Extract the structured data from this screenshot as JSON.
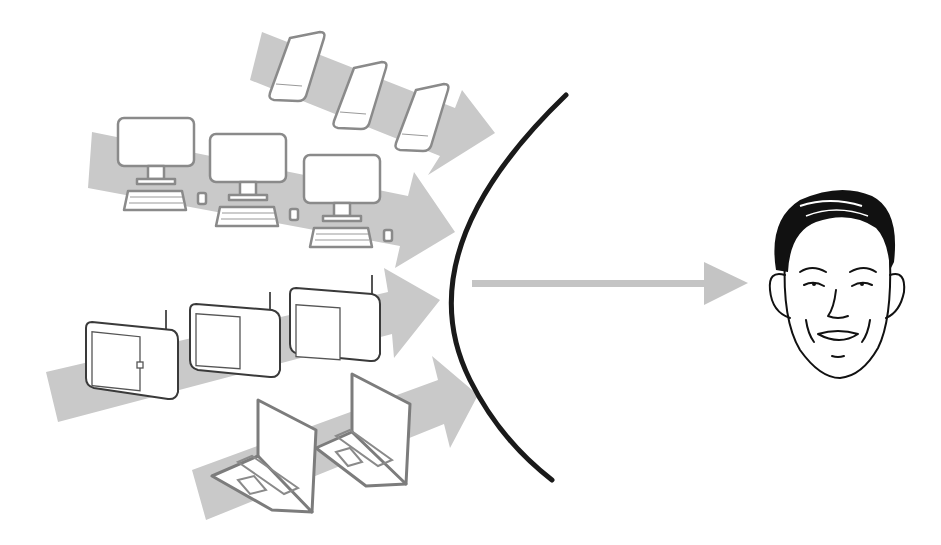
{
  "diagram": {
    "colors": {
      "background": "#ffffff",
      "band": "#c9c9c9",
      "barrier": "#1a1a1a",
      "device_outline": "#8a8a8a",
      "tv_outline": "#3a3a3a"
    },
    "streams": [
      {
        "id": "phones",
        "device": "smartphone-icon",
        "count": 3
      },
      {
        "id": "desktops",
        "device": "desktop-computer-icon",
        "count": 3
      },
      {
        "id": "tvs",
        "device": "television-icon",
        "count": 3
      },
      {
        "id": "laptops",
        "device": "laptop-icon",
        "count": 2
      }
    ],
    "barrier": {
      "shape": "arc",
      "icon": "curved-barrier"
    },
    "output_arrow": {
      "direction": "right"
    },
    "target": {
      "icon": "person-face-icon"
    }
  }
}
